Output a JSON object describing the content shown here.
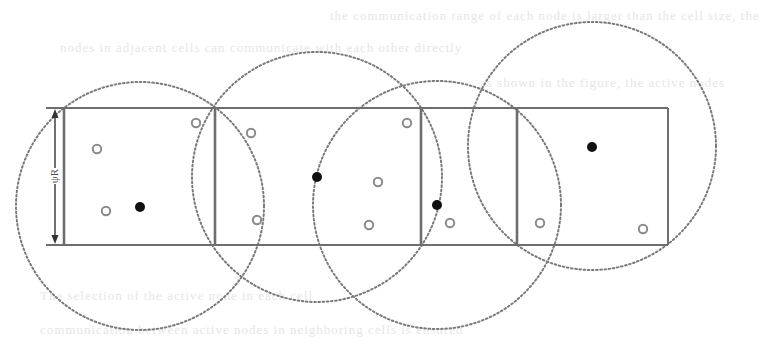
{
  "figure": {
    "kind": "grid cells with node coverage circles",
    "width": 731,
    "height": 354,
    "colors": {
      "background": "#ffffff",
      "cell_border": "#6e6e6e",
      "circle_stroke": "#7a7a7a",
      "filled_node": "#111111",
      "hollow_node_stroke": "#8a8a8a"
    },
    "dimension_label": {
      "text": "ψR",
      "x": 55,
      "y_top": 108,
      "y_bottom": 245
    },
    "grid": {
      "top": 108,
      "bottom": 245,
      "outer_left": 64,
      "outer_right": 668,
      "top_line_start": 46,
      "bottom_line_start": 46
    },
    "cells": [
      {
        "id": 1,
        "x1": 64,
        "x2": 215
      },
      {
        "id": 2,
        "x1": 215,
        "x2": 421
      },
      {
        "id": 3,
        "x1": 421,
        "x2": 517
      },
      {
        "id": 4,
        "x1": 517,
        "x2": 668
      }
    ],
    "circles": [
      {
        "id": "c1",
        "cx": 140,
        "cy": 206,
        "r": 124
      },
      {
        "id": "c2",
        "cx": 317,
        "cy": 177,
        "r": 125
      },
      {
        "id": "c3",
        "cx": 437,
        "cy": 205,
        "r": 124
      },
      {
        "id": "c4",
        "cx": 592,
        "cy": 146,
        "r": 124
      }
    ],
    "filled_nodes": [
      {
        "x": 140,
        "y": 207
      },
      {
        "x": 317,
        "y": 177
      },
      {
        "x": 437,
        "y": 205
      },
      {
        "x": 592,
        "y": 147
      }
    ],
    "hollow_nodes": [
      {
        "x": 97,
        "y": 149
      },
      {
        "x": 106,
        "y": 211
      },
      {
        "x": 196,
        "y": 123
      },
      {
        "x": 251,
        "y": 133
      },
      {
        "x": 257,
        "y": 220
      },
      {
        "x": 378,
        "y": 182
      },
      {
        "x": 369,
        "y": 225
      },
      {
        "x": 407,
        "y": 123
      },
      {
        "x": 450,
        "y": 223
      },
      {
        "x": 540,
        "y": 223
      },
      {
        "x": 643,
        "y": 229
      }
    ]
  },
  "background_text": {
    "lines": [
      {
        "text": "the communication range of each node is larger than the cell size, the",
        "x": 330,
        "y": 8
      },
      {
        "text": "nodes in adjacent cells can communicate with each other directly",
        "x": 60,
        "y": 40
      },
      {
        "text": "as shown in the figure, the active nodes",
        "x": 480,
        "y": 75
      },
      {
        "text": "The selection of the active node in each cell",
        "x": 40,
        "y": 288
      },
      {
        "text": "communication between active nodes in neighboring cells is ensured",
        "x": 40,
        "y": 322
      }
    ]
  }
}
